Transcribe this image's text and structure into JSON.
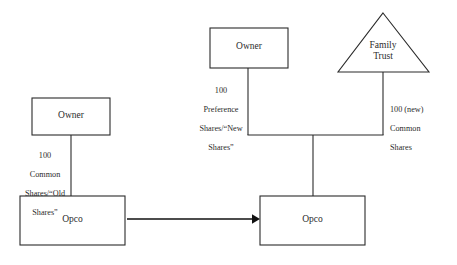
{
  "diagram": {
    "stroke_color": "#2b2b2b",
    "background_color": "#ffffff",
    "before": {
      "owner": {
        "label": "Owner"
      },
      "opco": {
        "label": "Opco"
      },
      "edge": {
        "line1": "100",
        "line2": "Common",
        "line3": "Shares/“Old",
        "line4": "Shares”"
      }
    },
    "transition": {
      "arrow_name": "transformation-arrow"
    },
    "after": {
      "owner": {
        "label": "Owner"
      },
      "trust": {
        "label_line1": "Family",
        "label_line2": "Trust"
      },
      "opco": {
        "label": "Opco"
      },
      "owner_edge": {
        "line1": "100",
        "line2": "Preference",
        "line3": "Shares/“New",
        "line4": "Shares”"
      },
      "trust_edge": {
        "line1": "100 (new)",
        "line2": "Common",
        "line3": "Shares"
      }
    }
  }
}
